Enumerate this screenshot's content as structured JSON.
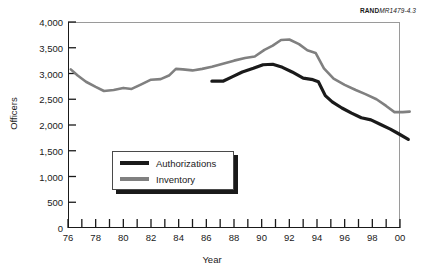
{
  "source_tag": {
    "brand": "RAND",
    "figure_id": "MR1479-4.3"
  },
  "legend": {
    "position": "inside-lower-left",
    "items": [
      {
        "label": "Authorizations",
        "color": "#1a1a1a"
      },
      {
        "label": "Inventory",
        "color": "#808080"
      }
    ]
  },
  "chart_data": {
    "type": "line",
    "title": "",
    "subtitle": "",
    "xlabel": "Year",
    "ylabel": "Officers",
    "xlim": [
      1976,
      2000
    ],
    "ylim": [
      0,
      4000
    ],
    "ytick_values": [
      0,
      500,
      1000,
      1500,
      2000,
      2500,
      3000,
      3500,
      4000
    ],
    "ytick_labels": [
      "0",
      "500",
      "1,000",
      "1,500",
      "2,000",
      "2,500",
      "3,000",
      "3,500",
      "4,000"
    ],
    "xtick_values": [
      1976,
      1977,
      1978,
      1979,
      1980,
      1981,
      1982,
      1983,
      1984,
      1985,
      1986,
      1987,
      1988,
      1989,
      1990,
      1991,
      1992,
      1993,
      1994,
      1995,
      1996,
      1997,
      1998,
      1999,
      2000
    ],
    "xtick_labels": [
      "76",
      "",
      "78",
      "",
      "80",
      "",
      "82",
      "",
      "84",
      "",
      "86",
      "",
      "88",
      "",
      "90",
      "",
      "92",
      "",
      "94",
      "",
      "96",
      "",
      "98",
      "",
      "00"
    ],
    "grid": false,
    "legend_position": "inside lower-left",
    "annotations": [
      "RAND MR1479-4.3"
    ],
    "series": [
      {
        "name": "Inventory",
        "color": "#808080",
        "x": [
          1976,
          1977,
          1978,
          1979,
          1980,
          1981,
          1982,
          1983,
          1984,
          1985,
          1986,
          1987,
          1988,
          1989,
          1990,
          1991,
          1992,
          1993,
          1994,
          1995,
          1996,
          1997,
          1998,
          1999,
          2000
        ],
        "values": [
          3080,
          2950,
          2790,
          2660,
          2700,
          2720,
          2700,
          2830,
          2890,
          2900,
          2930,
          3090,
          3080,
          3060,
          3120,
          3180,
          3260,
          3330,
          3380,
          3520,
          3600,
          3660,
          3650,
          3560,
          3400
        ]
      },
      {
        "name": "Authorizations",
        "color": "#1a1a1a",
        "x": [
          1986,
          1987,
          1988,
          1989,
          1990,
          1991,
          1992,
          1993,
          1994,
          1995,
          1996,
          1997,
          1998,
          1999,
          2000
        ],
        "values": [
          2850,
          2860,
          2950,
          3050,
          3120,
          3180,
          3170,
          3050,
          2900,
          2870,
          2840,
          2620,
          2440,
          2320,
          2200
        ]
      }
    ],
    "series_full": [
      {
        "name": "Inventory",
        "color": "#808080",
        "points": [
          [
            1976.2,
            3080
          ],
          [
            1976.7,
            2960
          ],
          [
            1977.3,
            2840
          ],
          [
            1978.0,
            2740
          ],
          [
            1978.6,
            2660
          ],
          [
            1979.3,
            2680
          ],
          [
            1980.0,
            2720
          ],
          [
            1980.6,
            2700
          ],
          [
            1981.3,
            2790
          ],
          [
            1982.0,
            2880
          ],
          [
            1982.7,
            2890
          ],
          [
            1983.3,
            2960
          ],
          [
            1983.8,
            3090
          ],
          [
            1984.3,
            3080
          ],
          [
            1985.0,
            3060
          ],
          [
            1985.7,
            3090
          ],
          [
            1986.4,
            3130
          ],
          [
            1987.2,
            3190
          ],
          [
            1988.0,
            3250
          ],
          [
            1988.8,
            3300
          ],
          [
            1989.5,
            3330
          ],
          [
            1990.2,
            3460
          ],
          [
            1990.8,
            3540
          ],
          [
            1991.4,
            3650
          ],
          [
            1992.0,
            3660
          ],
          [
            1992.7,
            3570
          ],
          [
            1993.3,
            3450
          ],
          [
            1993.9,
            3400
          ],
          [
            1994.5,
            3100
          ],
          [
            1995.2,
            2900
          ],
          [
            1996.0,
            2780
          ],
          [
            1996.8,
            2680
          ],
          [
            1997.5,
            2600
          ],
          [
            1998.3,
            2500
          ],
          [
            1999.0,
            2370
          ],
          [
            1999.6,
            2250
          ],
          [
            2000.2,
            2250
          ],
          [
            2000.7,
            2260
          ]
        ]
      },
      {
        "name": "Authorizations",
        "color": "#1a1a1a",
        "points": [
          [
            1986.4,
            2850
          ],
          [
            1987.2,
            2850
          ],
          [
            1987.9,
            2940
          ],
          [
            1988.6,
            3030
          ],
          [
            1989.4,
            3100
          ],
          [
            1990.1,
            3170
          ],
          [
            1990.8,
            3180
          ],
          [
            1991.5,
            3120
          ],
          [
            1992.2,
            3030
          ],
          [
            1993.0,
            2910
          ],
          [
            1993.7,
            2880
          ],
          [
            1994.1,
            2840
          ],
          [
            1994.6,
            2570
          ],
          [
            1995.1,
            2450
          ],
          [
            1995.8,
            2330
          ],
          [
            1996.5,
            2230
          ],
          [
            1997.2,
            2140
          ],
          [
            1997.9,
            2100
          ],
          [
            1998.6,
            2010
          ],
          [
            1999.3,
            1920
          ],
          [
            1999.9,
            1830
          ],
          [
            2000.6,
            1720
          ]
        ]
      }
    ]
  }
}
